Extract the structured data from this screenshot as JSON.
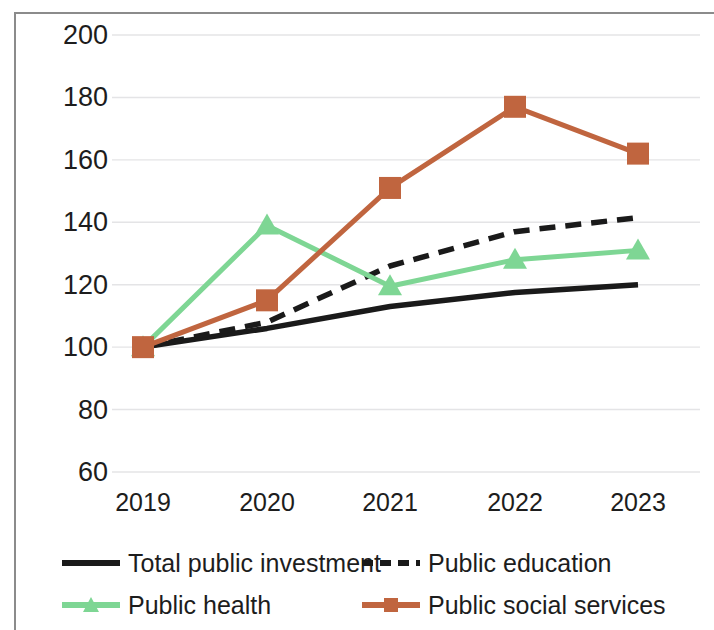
{
  "chart_data": {
    "type": "line",
    "title": "",
    "xlabel": "",
    "ylabel": "",
    "categories": [
      "2019",
      "2020",
      "2021",
      "2022",
      "2023"
    ],
    "ylim": [
      60,
      200
    ],
    "ytick_values": [
      200,
      180,
      160,
      140,
      120,
      100,
      80,
      60
    ],
    "ytick_labels": [
      "200",
      "180",
      "160",
      "140",
      "120",
      "100",
      "80",
      "60"
    ],
    "grid": "horizontal",
    "legend_position": "bottom",
    "series": [
      {
        "name": "Total public investment",
        "values": [
          100,
          106,
          113,
          117.5,
          120
        ],
        "color": "#1a1a1a",
        "style": "solid",
        "marker": "none"
      },
      {
        "name": "Public education",
        "values": [
          100,
          108,
          126,
          137,
          141.5
        ],
        "color": "#1a1a1a",
        "style": "dashed",
        "marker": "none"
      },
      {
        "name": "Public health",
        "values": [
          100,
          139,
          119.5,
          128,
          131
        ],
        "color": "#7ed694",
        "style": "solid",
        "marker": "triangle"
      },
      {
        "name": "Public social services",
        "values": [
          100,
          115,
          151,
          177,
          162
        ],
        "color": "#c0653f",
        "style": "solid",
        "marker": "square"
      }
    ]
  },
  "colors": {
    "axis_text": "#1d1d1d",
    "frame": "#8b8b8b",
    "gridline": "#e4e4e6",
    "background": "#ffffff"
  }
}
